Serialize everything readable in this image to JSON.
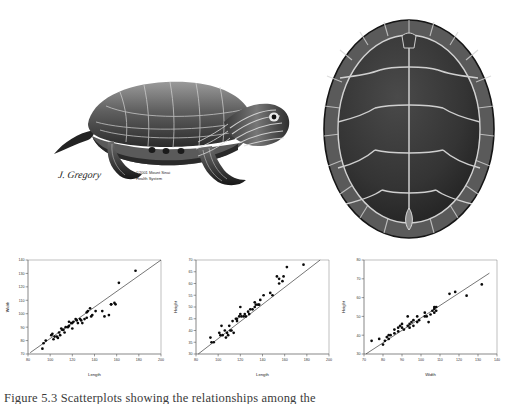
{
  "figure": {
    "caption": "Figure 5.3 Scatterplots showing the relationships among the",
    "illustrations": [
      {
        "name": "painted-turtle-lateral",
        "description": "Lateral view illustration of a painted turtle",
        "watermark_signature": "J. Gregory",
        "watermark_line1": "©2001 Mount Sinai",
        "watermark_line2": "Health System"
      },
      {
        "name": "turtle-carapace-dorsal",
        "description": "Dorsal view illustration of a turtle carapace showing scutes"
      }
    ]
  },
  "chart_data": [
    {
      "type": "scatter",
      "title": "",
      "xlabel": "Length",
      "ylabel": "Width",
      "xlim": [
        80,
        200
      ],
      "ylim": [
        70,
        140
      ],
      "xticks": [
        80,
        100,
        120,
        140,
        160,
        180,
        200
      ],
      "yticks": [
        70,
        80,
        90,
        100,
        110,
        120,
        130,
        140
      ],
      "grid": false,
      "legend": "none",
      "fit_line": {
        "x": [
          82,
          200
        ],
        "y": [
          71,
          140
        ]
      },
      "x": [
        93,
        94,
        96,
        101,
        102,
        103,
        104,
        106,
        107,
        108,
        109,
        110,
        111,
        112,
        113,
        114,
        116,
        117,
        117,
        119,
        120,
        120,
        121,
        123,
        124,
        125,
        127,
        128,
        129,
        131,
        133,
        133,
        134,
        136,
        137,
        138,
        141,
        147,
        149,
        153,
        155,
        155,
        158,
        159,
        162,
        177
      ],
      "y": [
        74,
        78,
        80,
        84,
        85,
        81,
        83,
        83,
        82,
        86,
        84,
        89,
        88,
        88,
        86,
        90,
        90,
        91,
        94,
        93,
        89,
        93,
        94,
        96,
        95,
        93,
        96,
        95,
        93,
        96,
        101,
        97,
        102,
        104,
        98,
        99,
        102,
        102,
        98,
        99,
        107,
        107,
        108,
        107,
        123,
        132
      ]
    },
    {
      "type": "scatter",
      "title": "",
      "xlabel": "Length",
      "ylabel": "Height",
      "xlim": [
        80,
        200
      ],
      "ylim": [
        30,
        70
      ],
      "xticks": [
        80,
        100,
        120,
        140,
        160,
        180,
        200
      ],
      "yticks": [
        30,
        35,
        40,
        45,
        50,
        55,
        60,
        65,
        70
      ],
      "grid": false,
      "legend": "none",
      "fit_line": {
        "x": [
          82,
          192
        ],
        "y": [
          30,
          70
        ]
      },
      "x": [
        93,
        94,
        96,
        101,
        102,
        103,
        104,
        106,
        107,
        108,
        109,
        110,
        111,
        112,
        113,
        114,
        116,
        117,
        117,
        119,
        120,
        120,
        121,
        123,
        124,
        125,
        127,
        128,
        129,
        131,
        133,
        133,
        134,
        136,
        137,
        138,
        141,
        147,
        149,
        153,
        155,
        155,
        158,
        159,
        162,
        177
      ],
      "y": [
        37,
        35,
        35,
        39,
        38,
        42,
        38,
        40,
        37,
        39,
        38,
        42,
        40,
        40,
        44,
        39,
        45,
        45,
        44,
        46,
        47,
        50,
        46,
        46,
        47,
        46,
        48,
        47,
        49,
        49,
        50,
        52,
        51,
        51,
        51,
        53,
        55,
        56,
        55,
        63,
        60,
        62,
        61,
        63,
        67,
        68
      ]
    },
    {
      "type": "scatter",
      "title": "",
      "xlabel": "Width",
      "ylabel": "Height",
      "xlim": [
        70,
        140
      ],
      "ylim": [
        30,
        80
      ],
      "xticks": [
        70,
        80,
        90,
        100,
        110,
        120,
        130,
        140
      ],
      "yticks": [
        30,
        40,
        50,
        60,
        70,
        80
      ],
      "grid": false,
      "legend": "none",
      "fit_line": {
        "x": [
          71,
          136
        ],
        "y": [
          30,
          73
        ]
      },
      "x": [
        74,
        78,
        80,
        81,
        82,
        83,
        83,
        84,
        86,
        86,
        88,
        88,
        89,
        90,
        90,
        91,
        93,
        93,
        94,
        94,
        95,
        96,
        96,
        98,
        98,
        99,
        102,
        102,
        103,
        104,
        105,
        106,
        107,
        107,
        107,
        108,
        108,
        115,
        118,
        124,
        132
      ],
      "y": [
        37,
        38,
        35,
        37,
        39,
        38,
        40,
        40,
        41,
        43,
        42,
        44,
        45,
        44,
        46,
        43,
        45,
        50,
        44,
        46,
        47,
        45,
        48,
        47,
        50,
        48,
        50,
        52,
        50,
        47,
        51,
        53,
        54,
        55,
        52,
        53,
        55,
        62,
        63,
        61,
        67
      ]
    }
  ]
}
